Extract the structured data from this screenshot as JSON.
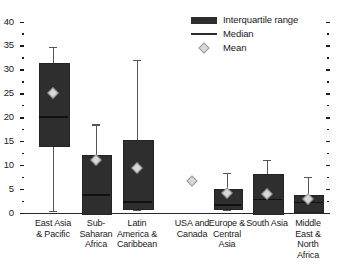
{
  "chart_data": {
    "type": "box",
    "title": "",
    "xlabel": "",
    "ylabel": "",
    "ylim": [
      0,
      40
    ],
    "yticks": [
      0,
      5,
      10,
      15,
      20,
      25,
      30,
      35,
      40
    ],
    "ytick_labels": [
      "0",
      "5",
      "10",
      "15",
      "20",
      "25",
      "30",
      "35",
      "40"
    ],
    "minor_tick_step": 2.5,
    "grid": false,
    "legend_position": "top-right",
    "legend": [
      {
        "key": "iqr",
        "label": "Interquartile range",
        "marker": "filled-bar",
        "color": "#2e2e2e"
      },
      {
        "key": "median",
        "label": "Median",
        "marker": "line",
        "color": "#2b2b2b"
      },
      {
        "key": "mean",
        "label": "Mean",
        "marker": "diamond",
        "color": "#d8d8d8"
      }
    ],
    "categories": [
      "East Asia & Pacific",
      "Sub-Saharan Africa",
      "Latin America & Caribbean",
      "USA and Canada",
      "Europe & Central Asia",
      "South Asia",
      "Middle East & North Africa"
    ],
    "category_label_lines": [
      [
        "East Asia",
        "& Pacific"
      ],
      [
        "Sub-",
        "Saharan",
        "Africa"
      ],
      [
        "Latin",
        "America &",
        "Caribbean"
      ],
      [
        "USA and",
        "Canada"
      ],
      [
        "Europe &",
        "Central",
        "Asia"
      ],
      [
        "South Asia"
      ],
      [
        "Middle",
        "East &",
        "North",
        "Africa"
      ]
    ],
    "boxes": [
      {
        "category": "East Asia & Pacific",
        "whisker_low": 0.4,
        "q1": 14.2,
        "median": 20.1,
        "q3": 31.3,
        "whisker_high": 34.7,
        "mean": 25.0
      },
      {
        "category": "Sub-Saharan Africa",
        "whisker_low": 0.0,
        "q1": 0.0,
        "median": 3.8,
        "q3": 12.2,
        "whisker_high": 18.5,
        "mean": 11.0
      },
      {
        "category": "Latin America & Caribbean",
        "whisker_low": 0.6,
        "q1": 1.0,
        "median": 2.3,
        "q3": 15.3,
        "whisker_high": 32.0,
        "mean": 9.4
      },
      {
        "category": "USA and Canada",
        "whisker_low": null,
        "q1": null,
        "median": null,
        "q3": null,
        "whisker_high": null,
        "mean": 6.6
      },
      {
        "category": "Europe & Central Asia",
        "whisker_low": 0.6,
        "q1": 1.1,
        "median": 1.7,
        "q3": 5.0,
        "whisker_high": 8.3,
        "mean": 4.2
      },
      {
        "category": "South Asia",
        "whisker_low": 0.0,
        "q1": 0.0,
        "median": 2.8,
        "q3": 8.2,
        "whisker_high": 11.0,
        "mean": 4.0
      },
      {
        "category": "Middle East & North Africa",
        "whisker_low": 0.4,
        "q1": 0.5,
        "median": 2.2,
        "q3": 3.8,
        "whisker_high": 7.5,
        "mean": 3.0
      }
    ]
  }
}
